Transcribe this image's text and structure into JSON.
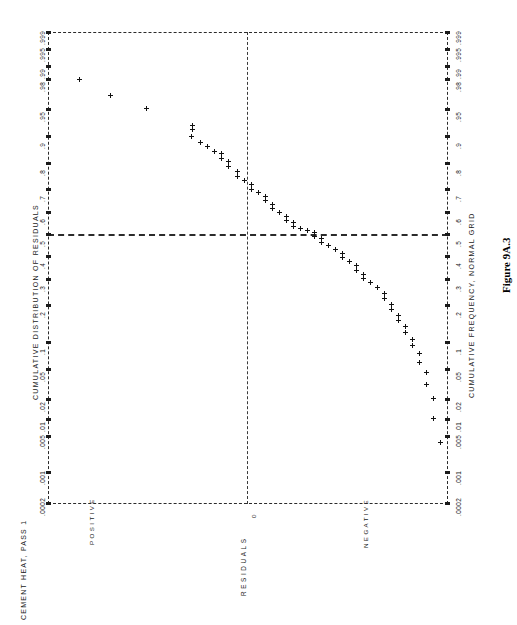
{
  "figure": {
    "number": "Figure 9A.3",
    "header": "CEMENT HEAT, PASS 1",
    "left_axis_title": "CUMULATIVE DISTRIBUTION OF RESIDUALS",
    "right_axis_title": "CUMULATIVE FREQUENCY, NORMAL GRID",
    "value_axis_caption": "RESIDUALS",
    "direction_labels": {
      "positive": "POSITIVE",
      "zero": "0",
      "negative": "NEGATIVE"
    }
  },
  "chart_data": {
    "type": "scatter",
    "title": "CUMULATIVE DISTRIBUTION OF RESIDUALS",
    "subtitle": "CEMENT HEAT, PASS 1",
    "xlabel": "RESIDUALS",
    "ylabel": "CUMULATIVE FREQUENCY, NORMAL GRID",
    "grid": "normal-probability",
    "orientation": "rotated-90-ccw",
    "legend": "none",
    "annotations": [
      "POSITIVE",
      "0",
      "NEGATIVE"
    ],
    "prob_ticks": [
      ".0002",
      ".001",
      ".005",
      ".01",
      ".02",
      ".05",
      ".1",
      ".2",
      ".3",
      ".4",
      ".5",
      ".6",
      ".7",
      ".8",
      ".9",
      ".95",
      ".98",
      ".99",
      ".995",
      ".999"
    ],
    "prob_tick_values": [
      0.0002,
      0.001,
      0.005,
      0.01,
      0.02,
      0.05,
      0.1,
      0.2,
      0.3,
      0.4,
      0.5,
      0.6,
      0.7,
      0.8,
      0.9,
      0.95,
      0.98,
      0.99,
      0.995,
      0.999
    ],
    "prob_tick_positions_px": [
      471,
      440,
      404,
      387,
      367,
      337,
      310,
      273,
      247,
      224,
      202,
      180,
      157,
      131,
      104,
      77,
      47,
      34,
      17,
      0
    ],
    "xlim_note": "residual axis: POSITIVE at left, 0 at centre (x=199px), NEGATIVE at right",
    "ylim": [
      0.0002,
      0.999
    ],
    "reference_lines": [
      {
        "name": "median-line",
        "axis": "probability",
        "value": 0.5
      },
      {
        "name": "zero-residual-line",
        "axis": "residual",
        "value": 0
      }
    ],
    "n_points": 62,
    "points": [
      {
        "x": 31,
        "y": 47
      },
      {
        "x": 62,
        "y": 63
      },
      {
        "x": 98,
        "y": 76
      },
      {
        "x": 144,
        "y": 93
      },
      {
        "x": 144,
        "y": 97
      },
      {
        "x": 143,
        "y": 104
      },
      {
        "x": 152,
        "y": 110
      },
      {
        "x": 159,
        "y": 114
      },
      {
        "x": 166,
        "y": 119
      },
      {
        "x": 173,
        "y": 121
      },
      {
        "x": 173,
        "y": 126
      },
      {
        "x": 180,
        "y": 129
      },
      {
        "x": 180,
        "y": 134
      },
      {
        "x": 189,
        "y": 139
      },
      {
        "x": 189,
        "y": 144
      },
      {
        "x": 196,
        "y": 148
      },
      {
        "x": 203,
        "y": 152
      },
      {
        "x": 203,
        "y": 157
      },
      {
        "x": 210,
        "y": 160
      },
      {
        "x": 217,
        "y": 164
      },
      {
        "x": 217,
        "y": 168
      },
      {
        "x": 224,
        "y": 172
      },
      {
        "x": 224,
        "y": 176
      },
      {
        "x": 231,
        "y": 180
      },
      {
        "x": 238,
        "y": 184
      },
      {
        "x": 238,
        "y": 188
      },
      {
        "x": 245,
        "y": 190
      },
      {
        "x": 245,
        "y": 194
      },
      {
        "x": 252,
        "y": 196
      },
      {
        "x": 259,
        "y": 198
      },
      {
        "x": 266,
        "y": 200
      },
      {
        "x": 266,
        "y": 204
      },
      {
        "x": 273,
        "y": 206
      },
      {
        "x": 273,
        "y": 210
      },
      {
        "x": 280,
        "y": 213
      },
      {
        "x": 287,
        "y": 217
      },
      {
        "x": 294,
        "y": 221
      },
      {
        "x": 294,
        "y": 225
      },
      {
        "x": 301,
        "y": 229
      },
      {
        "x": 308,
        "y": 233
      },
      {
        "x": 308,
        "y": 238
      },
      {
        "x": 315,
        "y": 242
      },
      {
        "x": 315,
        "y": 246
      },
      {
        "x": 322,
        "y": 250
      },
      {
        "x": 329,
        "y": 255
      },
      {
        "x": 336,
        "y": 261
      },
      {
        "x": 336,
        "y": 266
      },
      {
        "x": 343,
        "y": 272
      },
      {
        "x": 343,
        "y": 277
      },
      {
        "x": 350,
        "y": 283
      },
      {
        "x": 350,
        "y": 288
      },
      {
        "x": 357,
        "y": 294
      },
      {
        "x": 357,
        "y": 300
      },
      {
        "x": 364,
        "y": 307
      },
      {
        "x": 364,
        "y": 313
      },
      {
        "x": 371,
        "y": 321
      },
      {
        "x": 371,
        "y": 330
      },
      {
        "x": 378,
        "y": 340
      },
      {
        "x": 378,
        "y": 352
      },
      {
        "x": 385,
        "y": 366
      },
      {
        "x": 385,
        "y": 386
      },
      {
        "x": 392,
        "y": 410
      }
    ]
  }
}
